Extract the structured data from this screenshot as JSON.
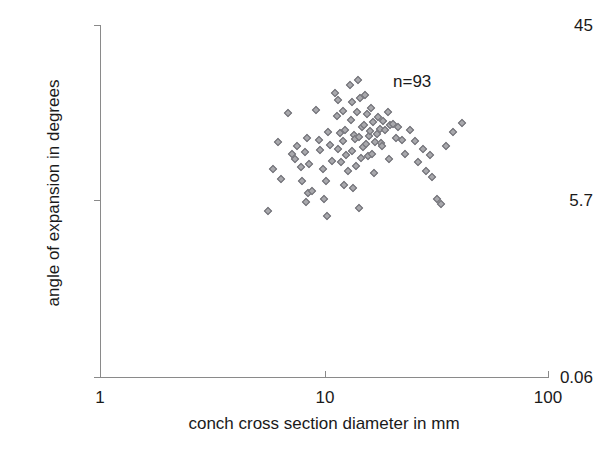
{
  "chart_data": {
    "type": "scatter",
    "title": "",
    "xlabel": "conch cross section diameter in mm",
    "ylabel": "angle of expansion in degrees",
    "xscale": "log",
    "yscale": "log",
    "xlim": [
      1,
      100
    ],
    "ylim": [
      0.06,
      45
    ],
    "xticks": [
      1,
      10,
      100
    ],
    "xticklabels": [
      "1",
      "10",
      "100"
    ],
    "yticks": [
      0.06,
      5.7,
      45
    ],
    "yticklabels": [
      "0.06",
      "5.7",
      "45"
    ],
    "grid": false,
    "legend": null,
    "annotations": [
      {
        "text": "n=93",
        "x": 24.0,
        "y": 19.5
      }
    ],
    "marker": {
      "shape": "diamond",
      "size": 6,
      "fill": "#a8a8ac",
      "edge": "#6e6e74"
    },
    "n": 93,
    "series": [
      {
        "name": "conch measurements",
        "points": [
          [
            5.9,
            3.0
          ],
          [
            6.2,
            5.0
          ],
          [
            6.4,
            2.5
          ],
          [
            5.6,
            1.35
          ],
          [
            6.9,
            8.6
          ],
          [
            7.4,
            3.6
          ],
          [
            7.2,
            4.0
          ],
          [
            7.6,
            4.6
          ],
          [
            7.9,
            3.1
          ],
          [
            8.2,
            4.1
          ],
          [
            8.0,
            2.4
          ],
          [
            8.4,
            5.4
          ],
          [
            8.6,
            3.3
          ],
          [
            8.5,
            1.9
          ],
          [
            8.8,
            2.0
          ],
          [
            8.3,
            1.6
          ],
          [
            9.2,
            9.1
          ],
          [
            9.6,
            4.3
          ],
          [
            9.5,
            5.2
          ],
          [
            9.9,
            3.0
          ],
          [
            10.2,
            2.4
          ],
          [
            10.0,
            1.7
          ],
          [
            10.4,
            6.0
          ],
          [
            10.6,
            4.7
          ],
          [
            10.9,
            3.5
          ],
          [
            10.3,
            1.25
          ],
          [
            11.2,
            12.5
          ],
          [
            11.6,
            11.0
          ],
          [
            11.4,
            8.2
          ],
          [
            11.8,
            5.9
          ],
          [
            11.5,
            4.4
          ],
          [
            11.9,
            3.4
          ],
          [
            12.2,
            9.0
          ],
          [
            12.4,
            6.3
          ],
          [
            12.1,
            5.1
          ],
          [
            12.6,
            3.9
          ],
          [
            12.8,
            2.9
          ],
          [
            12.3,
            2.2
          ],
          [
            13.1,
            14.5
          ],
          [
            13.4,
            10.5
          ],
          [
            13.2,
            7.6
          ],
          [
            13.6,
            5.7
          ],
          [
            13.8,
            5.3
          ],
          [
            13.3,
            4.2
          ],
          [
            13.9,
            3.2
          ],
          [
            13.5,
            2.1
          ],
          [
            14.2,
            16.0
          ],
          [
            14.5,
            11.5
          ],
          [
            14.1,
            8.8
          ],
          [
            14.8,
            6.6
          ],
          [
            14.4,
            5.5
          ],
          [
            14.9,
            4.5
          ],
          [
            14.6,
            3.7
          ],
          [
            14.3,
            1.45
          ],
          [
            15.3,
            12.0
          ],
          [
            15.6,
            8.4
          ],
          [
            15.1,
            6.8
          ],
          [
            15.9,
            5.6
          ],
          [
            15.4,
            4.8
          ],
          [
            15.7,
            3.8
          ],
          [
            16.2,
            9.4
          ],
          [
            16.6,
            7.2
          ],
          [
            16.1,
            6.1
          ],
          [
            16.9,
            5.0
          ],
          [
            16.4,
            4.0
          ],
          [
            16.8,
            2.8
          ],
          [
            17.4,
            8.0
          ],
          [
            17.8,
            6.4
          ],
          [
            17.2,
            5.8
          ],
          [
            17.9,
            4.9
          ],
          [
            18.4,
            7.4
          ],
          [
            18.8,
            6.2
          ],
          [
            18.2,
            4.6
          ],
          [
            19.3,
            8.8
          ],
          [
            19.8,
            6.9
          ],
          [
            19.5,
            3.6
          ],
          [
            20.4,
            7.0
          ],
          [
            20.9,
            5.4
          ],
          [
            21.5,
            6.6
          ],
          [
            22.3,
            5.2
          ],
          [
            23.1,
            4.0
          ],
          [
            24.2,
            6.2
          ],
          [
            25.4,
            5.1
          ],
          [
            26.3,
            3.4
          ],
          [
            27.6,
            4.4
          ],
          [
            28.4,
            2.9
          ],
          [
            29.8,
            3.9
          ],
          [
            30.5,
            2.6
          ],
          [
            31.9,
            1.7
          ],
          [
            33.4,
            1.55
          ],
          [
            35.2,
            4.6
          ],
          [
            37.8,
            6.0
          ],
          [
            41.5,
            7.1
          ]
        ]
      }
    ]
  },
  "axes": {
    "y_label": "angle of expansion in degrees",
    "x_label": "conch cross section diameter in mm",
    "y_tick_top": "45",
    "y_tick_mid": "5.7",
    "y_tick_bottom": "0.06",
    "x_tick_left": "1",
    "x_tick_mid": "10",
    "x_tick_right": "100"
  },
  "annotation_text": "n=93"
}
